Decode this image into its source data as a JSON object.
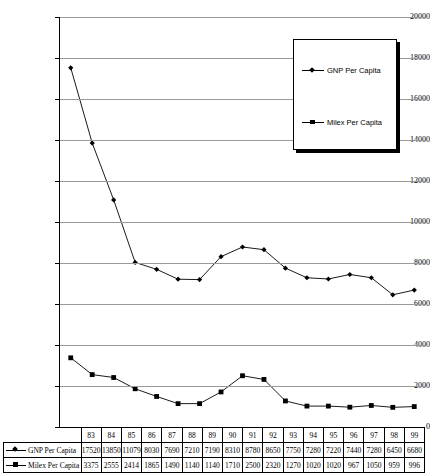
{
  "chart_data": {
    "type": "line",
    "title": "",
    "xlabel": "",
    "ylabel": "",
    "ylim": [
      0,
      20000
    ],
    "y_ticks": [
      0,
      2000,
      4000,
      6000,
      8000,
      10000,
      12000,
      14000,
      16000,
      18000,
      20000
    ],
    "grid": true,
    "legend_position": "top-right",
    "categories": [
      "83",
      "84",
      "85",
      "86",
      "87",
      "88",
      "89",
      "90",
      "91",
      "92",
      "93",
      "94",
      "95",
      "96",
      "97",
      "98",
      "99"
    ],
    "series": [
      {
        "name": "GNP Per Capita",
        "marker": "diamond",
        "values": [
          17520,
          13850,
          11079,
          8030,
          7690,
          7210,
          7190,
          8310,
          8780,
          8650,
          7750,
          7280,
          7220,
          7440,
          7280,
          6450,
          6680
        ]
      },
      {
        "name": "Milex Per Capita",
        "marker": "square",
        "values": [
          3375,
          2555,
          2414,
          1865,
          1490,
          1140,
          1140,
          1710,
          2500,
          2320,
          1270,
          1020,
          1020,
          967,
          1050,
          959,
          996
        ]
      }
    ]
  },
  "legend": {
    "entries": [
      {
        "label": "GNP Per Capita"
      },
      {
        "label": "Milex Per Capita"
      }
    ]
  },
  "table": {
    "row_labels": [
      "GNP Per Capita",
      "Milex Per Capita"
    ]
  },
  "colors": {
    "line": "#000000",
    "grid": "#9a9a9a",
    "axis": "#000000",
    "background": "#ffffff"
  }
}
